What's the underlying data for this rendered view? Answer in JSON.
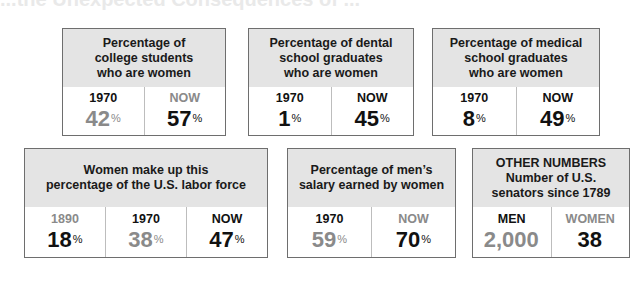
{
  "header_fragment": "...the Unexpected Consequences of ...",
  "boxes": [
    {
      "title": "Percentage of\ncollege students\nwho are women",
      "cells": [
        {
          "label": "1970",
          "label_tone": "dark",
          "value": "42",
          "unit": "%",
          "value_tone": "gray"
        },
        {
          "label": "NOW",
          "label_tone": "gray",
          "value": "57",
          "unit": "%",
          "value_tone": "dark"
        }
      ]
    },
    {
      "title": "Percentage of dental\nschool graduates\nwho are women",
      "cells": [
        {
          "label": "1970",
          "label_tone": "dark",
          "value": "1",
          "unit": "%",
          "value_tone": "dark"
        },
        {
          "label": "NOW",
          "label_tone": "dark",
          "value": "45",
          "unit": "%",
          "value_tone": "dark"
        }
      ]
    },
    {
      "title": "Percentage of medical\nschool graduates\nwho are women",
      "cells": [
        {
          "label": "1970",
          "label_tone": "dark",
          "value": "8",
          "unit": "%",
          "value_tone": "dark"
        },
        {
          "label": "NOW",
          "label_tone": "dark",
          "value": "49",
          "unit": "%",
          "value_tone": "dark"
        }
      ]
    },
    {
      "title": "Women make up this\npercentage of the U.S. labor force",
      "cells": [
        {
          "label": "1890",
          "label_tone": "gray",
          "value": "18",
          "unit": "%",
          "value_tone": "dark"
        },
        {
          "label": "1970",
          "label_tone": "dark",
          "value": "38",
          "unit": "%",
          "value_tone": "gray"
        },
        {
          "label": "NOW",
          "label_tone": "dark",
          "value": "47",
          "unit": "%",
          "value_tone": "dark"
        }
      ]
    },
    {
      "title": "Percentage of men’s\nsalary earned by women",
      "cells": [
        {
          "label": "1970",
          "label_tone": "dark",
          "value": "59",
          "unit": "%",
          "value_tone": "gray"
        },
        {
          "label": "NOW",
          "label_tone": "gray",
          "value": "70",
          "unit": "%",
          "value_tone": "dark"
        }
      ]
    },
    {
      "title": "OTHER NUMBERS\nNumber of U.S.\nsenators since 1789",
      "cells": [
        {
          "label": "MEN",
          "label_tone": "dark",
          "value": "2,000",
          "unit": "",
          "value_tone": "gray"
        },
        {
          "label": "WOMEN",
          "label_tone": "gray",
          "value": "38",
          "unit": "",
          "value_tone": "dark"
        }
      ]
    }
  ],
  "colors": {
    "dark": "#111111",
    "gray": "#8a8a8a",
    "title_bg": "#e4e4e4",
    "border": "#6e6e6e"
  }
}
